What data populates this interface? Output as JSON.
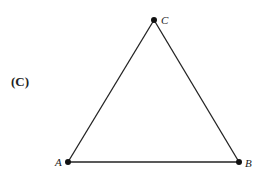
{
  "panel": {
    "label": "(C)"
  },
  "triangle": {
    "stroke_color": "#222222",
    "vertices": [
      {
        "name": "A",
        "x": 68,
        "y": 162,
        "label_x": 55,
        "label_y": 166
      },
      {
        "name": "B",
        "x": 239,
        "y": 162,
        "label_x": 245,
        "label_y": 167
      },
      {
        "name": "C",
        "x": 154,
        "y": 20,
        "label_x": 161,
        "label_y": 24
      }
    ]
  }
}
